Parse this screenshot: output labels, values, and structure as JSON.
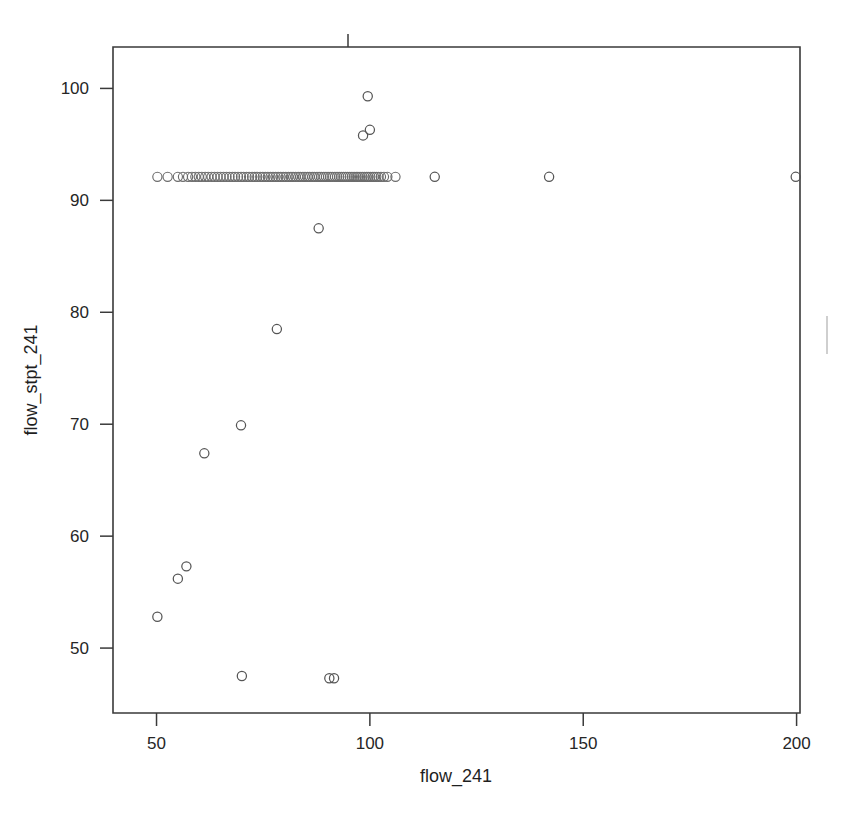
{
  "chart_data": {
    "type": "scatter",
    "title": "",
    "xlabel": "flow_241",
    "ylabel": "flow_stpt_241",
    "xlim": [
      39.8,
      200.8
    ],
    "ylim": [
      44.2,
      103.7
    ],
    "xticks": [
      50,
      100,
      150,
      200
    ],
    "xticklabels": [
      "50",
      "100",
      "150",
      "200"
    ],
    "yticks": [
      50,
      60,
      70,
      80,
      90,
      100
    ],
    "yticklabels": [
      "50",
      "60",
      "70",
      "80",
      "90",
      "100"
    ],
    "grid": false,
    "legend": false,
    "marker": "open-circle",
    "marker_color": "#555555",
    "frame": "box",
    "points": [
      [
        50.2,
        92.1
      ],
      [
        52.6,
        92.1
      ],
      [
        55.0,
        92.1
      ],
      [
        56.2,
        92.1
      ],
      [
        57.4,
        92.1
      ],
      [
        58.3,
        92.1
      ],
      [
        59.1,
        92.1
      ],
      [
        59.9,
        92.1
      ],
      [
        60.6,
        92.1
      ],
      [
        61.4,
        92.1
      ],
      [
        62.1,
        92.1
      ],
      [
        62.9,
        92.1
      ],
      [
        63.6,
        92.1
      ],
      [
        64.3,
        92.1
      ],
      [
        65.0,
        92.1
      ],
      [
        65.7,
        92.1
      ],
      [
        66.4,
        92.1
      ],
      [
        67.1,
        92.1
      ],
      [
        67.8,
        92.1
      ],
      [
        68.4,
        92.1
      ],
      [
        69.1,
        92.1
      ],
      [
        69.8,
        92.1
      ],
      [
        70.4,
        92.1
      ],
      [
        71.1,
        92.1
      ],
      [
        71.7,
        92.1
      ],
      [
        72.4,
        92.1
      ],
      [
        73.0,
        92.1
      ],
      [
        73.6,
        92.1
      ],
      [
        74.3,
        92.1
      ],
      [
        74.9,
        92.1
      ],
      [
        75.5,
        92.1
      ],
      [
        76.1,
        92.1
      ],
      [
        76.7,
        92.1
      ],
      [
        77.3,
        92.1
      ],
      [
        77.9,
        92.1
      ],
      [
        78.5,
        92.1
      ],
      [
        79.1,
        92.1
      ],
      [
        79.7,
        92.1
      ],
      [
        80.3,
        92.1
      ],
      [
        80.9,
        92.1
      ],
      [
        81.5,
        92.1
      ],
      [
        82.0,
        92.1
      ],
      [
        82.6,
        92.1
      ],
      [
        83.2,
        92.1
      ],
      [
        83.7,
        92.1
      ],
      [
        84.3,
        92.1
      ],
      [
        84.8,
        92.1
      ],
      [
        85.4,
        92.1
      ],
      [
        85.9,
        92.1
      ],
      [
        86.5,
        92.1
      ],
      [
        87.0,
        92.1
      ],
      [
        87.6,
        92.1
      ],
      [
        88.1,
        92.1
      ],
      [
        88.6,
        92.1
      ],
      [
        89.2,
        92.1
      ],
      [
        89.7,
        92.1
      ],
      [
        90.2,
        92.1
      ],
      [
        90.7,
        92.1
      ],
      [
        91.2,
        92.1
      ],
      [
        91.8,
        92.1
      ],
      [
        92.3,
        92.1
      ],
      [
        92.8,
        92.1
      ],
      [
        93.3,
        92.1
      ],
      [
        93.8,
        92.1
      ],
      [
        94.3,
        92.1
      ],
      [
        94.8,
        92.1
      ],
      [
        95.3,
        92.1
      ],
      [
        95.8,
        92.1
      ],
      [
        96.3,
        92.1
      ],
      [
        96.8,
        92.1
      ],
      [
        97.2,
        92.1
      ],
      [
        97.7,
        92.1
      ],
      [
        98.2,
        92.1
      ],
      [
        98.7,
        92.1
      ],
      [
        99.2,
        92.1
      ],
      [
        99.6,
        92.1
      ],
      [
        100.1,
        92.1
      ],
      [
        100.6,
        92.1
      ],
      [
        101.0,
        92.1
      ],
      [
        101.5,
        92.1
      ],
      [
        102.0,
        92.1
      ],
      [
        102.6,
        92.1
      ],
      [
        103.3,
        92.1
      ],
      [
        104.1,
        92.1
      ],
      [
        106.0,
        92.1
      ],
      [
        115.2,
        92.1
      ],
      [
        142.0,
        92.1
      ],
      [
        199.8,
        92.1
      ],
      [
        99.5,
        99.3
      ],
      [
        98.4,
        95.8
      ],
      [
        100.0,
        96.3
      ],
      [
        88.0,
        87.5
      ],
      [
        78.2,
        78.5
      ],
      [
        69.8,
        69.9
      ],
      [
        61.2,
        67.4
      ],
      [
        57.0,
        57.3
      ],
      [
        55.0,
        56.2
      ],
      [
        50.2,
        52.8
      ],
      [
        70.0,
        47.5
      ],
      [
        90.5,
        47.3
      ],
      [
        91.6,
        47.3
      ]
    ]
  },
  "axes": {
    "xlabel": "flow_241",
    "ylabel": "flow_stpt_241"
  }
}
